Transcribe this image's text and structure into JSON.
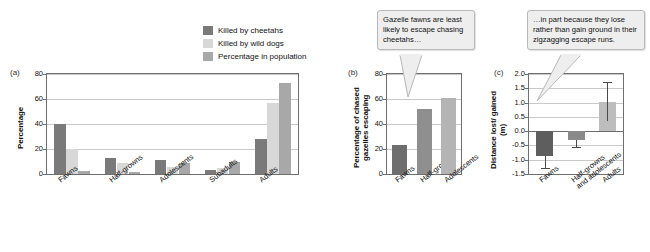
{
  "figure": {
    "legend": {
      "items": [
        {
          "label": "Killed by cheetahs",
          "color": "#7a7a7a"
        },
        {
          "label": "Killed by wild dogs",
          "color": "#d8d8d8"
        },
        {
          "label": "Percentage in population",
          "color": "#a8a8a8"
        }
      ]
    },
    "callouts": [
      {
        "name": "callout-panel-b",
        "text": "Gazelle fawns are least likely to escape chasing cheetahs…"
      },
      {
        "name": "callout-panel-c",
        "text": "…in part because they lose rather than gain ground in their zigzagging escape runs."
      }
    ],
    "panels": [
      {
        "letter": "(a)"
      },
      {
        "letter": "(b)"
      },
      {
        "letter": "(c)"
      }
    ]
  },
  "chart_data": [
    {
      "panel": "(a)",
      "type": "bar",
      "title": "",
      "xlabel": "",
      "ylabel": "Percentage",
      "ylim": [
        0,
        80
      ],
      "yticks": [
        0,
        20,
        40,
        60,
        80
      ],
      "ytick_labels": [
        "0",
        "20",
        "40",
        "60",
        "80"
      ],
      "grid": true,
      "legend_position": "top-right",
      "categories": [
        "Fawns",
        "Half-growns",
        "Adolescents",
        "Subadults",
        "Adults"
      ],
      "series": [
        {
          "name": "Killed by cheetahs",
          "color": "#7a7a7a",
          "values": [
            40,
            12.5,
            11.5,
            3.5,
            28
          ]
        },
        {
          "name": "Killed by wild dogs",
          "color": "#d8d8d8",
          "values": [
            20,
            8.5,
            5.5,
            5,
            57
          ]
        },
        {
          "name": "Percentage in population",
          "color": "#a8a8a8",
          "values": [
            2.5,
            2,
            8.5,
            9.5,
            73
          ]
        }
      ]
    },
    {
      "panel": "(b)",
      "type": "bar",
      "title": "",
      "xlabel": "",
      "ylabel": "Percentage of chased gazelles escaping",
      "ylim": [
        0,
        80
      ],
      "yticks": [
        0,
        20,
        40,
        60,
        80
      ],
      "ytick_labels": [
        "0",
        "20",
        "40",
        "60",
        "80"
      ],
      "grid": true,
      "categories": [
        "Fawns",
        "Half-growns",
        "Adolescents"
      ],
      "values": [
        23,
        52,
        61
      ],
      "colors": [
        "#6e6e6e",
        "#8f8f8f",
        "#b4b4b4"
      ]
    },
    {
      "panel": "(c)",
      "type": "bar",
      "title": "",
      "xlabel": "",
      "ylabel": "Distance lost/ gained (m)",
      "ylim": [
        -1.5,
        2.0
      ],
      "yticks": [
        -1.5,
        -1.0,
        -0.5,
        0.0,
        0.5,
        1.0,
        1.5,
        2.0
      ],
      "ytick_labels": [
        "-1.5",
        "-1.0",
        "-0.5",
        "0.0",
        "0.5",
        "1.0",
        "1.5",
        "2.0"
      ],
      "grid": true,
      "zero_line": 0.0,
      "categories": [
        "Fawns",
        "Half-growns and adolescents",
        "Adults"
      ],
      "values": [
        -0.87,
        -0.3,
        1.03
      ],
      "error_low": [
        -1.3,
        -0.57,
        0.35
      ],
      "error_high": [
        -0.87,
        -0.3,
        1.72
      ],
      "colors": [
        "#5e5e5e",
        "#8a8a8a",
        "#bdbdbd"
      ]
    }
  ]
}
